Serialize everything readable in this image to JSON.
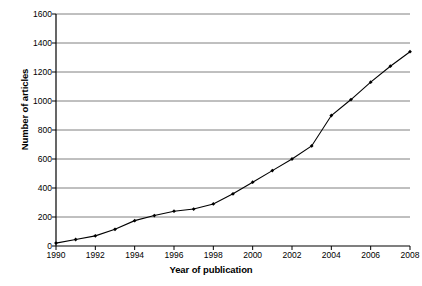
{
  "chart_data": {
    "type": "line",
    "title": "",
    "xlabel": "Year of publication",
    "ylabel": "Number of articles",
    "xlim": [
      1990,
      2008
    ],
    "ylim": [
      0,
      1600
    ],
    "ytick_step": 200,
    "xtick_step": 2,
    "grid": "horizontal",
    "legend": "none",
    "marker": "filled-diamond",
    "line_color": "#000000",
    "grid_color": "#808080",
    "axis_color": "#000000",
    "background": "#ffffff",
    "yticks": [
      0,
      200,
      400,
      600,
      800,
      1000,
      1200,
      1400,
      1600
    ],
    "xticks": [
      1990,
      1992,
      1994,
      1996,
      1998,
      2000,
      2002,
      2004,
      2006,
      2008
    ],
    "x": [
      1990,
      1991,
      1992,
      1993,
      1994,
      1995,
      1996,
      1997,
      1998,
      1999,
      2000,
      2001,
      2002,
      2003,
      2004,
      2005,
      2006,
      2007,
      2008
    ],
    "values": [
      20,
      45,
      70,
      115,
      175,
      210,
      240,
      255,
      290,
      360,
      440,
      520,
      600,
      690,
      900,
      1010,
      1130,
      1240,
      1340
    ],
    "series": [
      {
        "name": "Number of articles",
        "values": [
          20,
          45,
          70,
          115,
          175,
          210,
          240,
          255,
          290,
          360,
          440,
          520,
          600,
          690,
          900,
          1010,
          1130,
          1240,
          1340
        ]
      }
    ]
  }
}
